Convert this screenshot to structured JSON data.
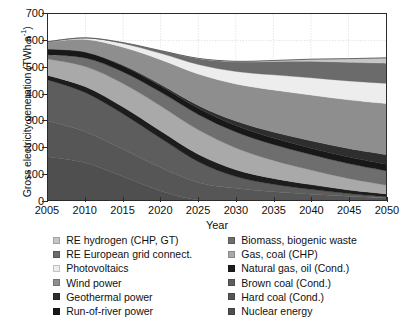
{
  "chart_data": {
    "type": "area",
    "title": "",
    "xlabel": "Year",
    "ylabel": "Gross electricity generation (TWh a",
    "ylabel_exponent": "-1",
    "ylabel_tail": ")",
    "xlim": [
      2005,
      2050
    ],
    "ylim": [
      0,
      700
    ],
    "yticks": [
      0,
      100,
      200,
      300,
      400,
      500,
      600,
      700
    ],
    "xticks": [
      2005,
      2010,
      2015,
      2020,
      2025,
      2030,
      2035,
      2040,
      2045,
      2050
    ],
    "grid": true,
    "stacked": true,
    "legend_position": "bottom",
    "x": [
      2005,
      2010,
      2015,
      2020,
      2025,
      2030,
      2035,
      2040,
      2045,
      2050
    ],
    "series": [
      {
        "name": "Nuclear energy",
        "color": "#4f4f4f",
        "values": [
          163,
          140,
          88,
          34,
          0,
          0,
          0,
          0,
          0,
          0
        ]
      },
      {
        "name": "Hard coal (Cond.)",
        "color": "#565656",
        "values": [
          134,
          117,
          103,
          88,
          66,
          44,
          31,
          22,
          14,
          8
        ]
      },
      {
        "name": "Brown coal (Cond.)",
        "color": "#5d5d5d",
        "values": [
          155,
          147,
          133,
          110,
          78,
          44,
          28,
          18,
          10,
          4
        ]
      },
      {
        "name": "Natural gas, oil (Cond.)",
        "color": "#1d1d1d",
        "values": [
          17,
          22,
          26,
          28,
          28,
          26,
          22,
          18,
          14,
          11
        ]
      },
      {
        "name": "Gas, coal (CHP)",
        "color": "#a9a9a9",
        "values": [
          62,
          76,
          88,
          94,
          92,
          82,
          68,
          55,
          43,
          33
        ]
      },
      {
        "name": "Biomass, biogenic waste",
        "color": "#6e6e6e",
        "values": [
          16,
          32,
          44,
          52,
          58,
          60,
          60,
          58,
          56,
          54
        ]
      },
      {
        "name": "Run-of-river power",
        "color": "#181818",
        "values": [
          21,
          22,
          22,
          23,
          23,
          24,
          24,
          24,
          25,
          25
        ]
      },
      {
        "name": "Geothermal power",
        "color": "#2e2e2e",
        "values": [
          0,
          1,
          3,
          6,
          11,
          17,
          23,
          28,
          32,
          36
        ]
      },
      {
        "name": "Wind power",
        "color": "#8e8e8e",
        "values": [
          27,
          47,
          68,
          93,
          118,
          140,
          158,
          172,
          183,
          192
        ]
      },
      {
        "name": "Photovoltaics",
        "color": "#ededed",
        "values": [
          1,
          6,
          14,
          24,
          36,
          47,
          57,
          65,
          71,
          76
        ]
      },
      {
        "name": "RE European grid connect.",
        "color": "#6b6b6b",
        "values": [
          0,
          0,
          3,
          10,
          22,
          36,
          50,
          62,
          70,
          76
        ]
      },
      {
        "name": "RE hydrogen (CHP, GT)",
        "color": "#c6c6c6",
        "values": [
          0,
          0,
          0,
          0,
          1,
          2,
          4,
          8,
          14,
          20
        ]
      }
    ],
    "totals": [
      596,
      610,
      592,
      562,
      533,
      522,
      525,
      530,
      532,
      535
    ]
  },
  "legend": {
    "left_column": [
      {
        "label": "RE hydrogen (CHP, GT)",
        "color": "#c6c6c6"
      },
      {
        "label": "RE European grid connect.",
        "color": "#6b6b6b"
      },
      {
        "label": "Photovoltaics",
        "color": "#ededed"
      },
      {
        "label": "Wind power",
        "color": "#8e8e8e"
      },
      {
        "label": "Geothermal power",
        "color": "#2e2e2e"
      },
      {
        "label": "Run-of-river power",
        "color": "#181818"
      }
    ],
    "right_column": [
      {
        "label": "Biomass, biogenic waste",
        "color": "#6e6e6e"
      },
      {
        "label": "Gas, coal (CHP)",
        "color": "#a9a9a9"
      },
      {
        "label": "Natural gas, oil (Cond.)",
        "color": "#1d1d1d"
      },
      {
        "label": "Brown coal (Cond.)",
        "color": "#5d5d5d"
      },
      {
        "label": "Hard coal (Cond.)",
        "color": "#565656"
      },
      {
        "label": "Nuclear energy",
        "color": "#4f4f4f"
      }
    ]
  }
}
